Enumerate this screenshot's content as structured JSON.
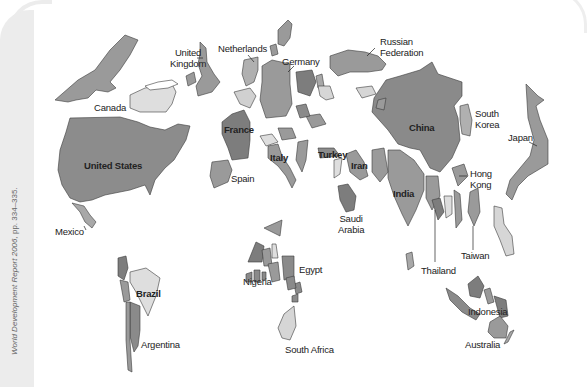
{
  "figure": {
    "type": "cartogram",
    "source_caption": {
      "title": "World Development Report 2006,",
      "pages": "pp. 334–335."
    }
  },
  "colors": {
    "dark": "#7d7d7d",
    "medium": "#9a9a9a",
    "light": "#c4c4c4",
    "pale": "#dedede",
    "outline": "#3a3a3a",
    "background_panel": "#ececec"
  },
  "labels": {
    "united_kingdom": "United\nKingdom",
    "united_kingdom_l1": "United",
    "united_kingdom_l2": "Kingdom",
    "netherlands": "Netherlands",
    "germany": "Germany",
    "russian_federation_l1": "Russian",
    "russian_federation_l2": "Federation",
    "canada": "Canada",
    "united_states": "United States",
    "france": "France",
    "italy": "Italy",
    "turkey": "Turkey",
    "iran": "Iran",
    "china": "China",
    "south_korea_l1": "South",
    "south_korea_l2": "Korea",
    "japan": "Japan",
    "hong_kong_l1": "Hong",
    "hong_kong_l2": "Kong",
    "spain": "Spain",
    "india": "India",
    "saudi_arabia_l1": "Saudi",
    "saudi_arabia_l2": "Arabia",
    "mexico": "Mexico",
    "nigeria": "Nigeria",
    "egypt": "Egypt",
    "brazil": "Brazil",
    "argentina": "Argentina",
    "thailand": "Thailand",
    "taiwan": "Taiwan",
    "indonesia": "Indonesia",
    "australia": "Australia",
    "south_africa": "South Africa"
  }
}
